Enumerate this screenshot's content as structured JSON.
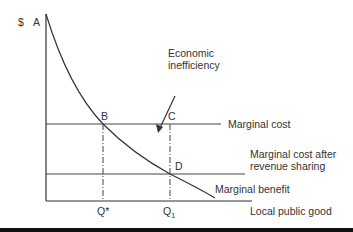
{
  "diagram": {
    "axis": {
      "y_label": "$",
      "x_label": "Local public good"
    },
    "points": {
      "A": "A",
      "B": "B",
      "C": "C",
      "D": "D"
    },
    "x_ticks": {
      "q_star": "Q*",
      "q1_base": "Q",
      "q1_sub": "1"
    },
    "lines": {
      "marginal_cost": "Marginal cost",
      "mc_after_line1": "Marginal cost after",
      "mc_after_line2": "revenue sharing",
      "marginal_benefit": "Marginal benefit"
    },
    "annotation": {
      "line1": "Economic",
      "line2": "inefficiency"
    },
    "colors": {
      "line": "#333333",
      "text": "#333333",
      "background": "#ffffff"
    }
  }
}
